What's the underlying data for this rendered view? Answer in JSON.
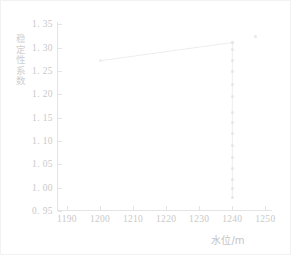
{
  "chart_data": {
    "type": "line",
    "title": "",
    "subtitle": "",
    "xlabel": "水位/m",
    "ylabel": "稳定性系数",
    "xlim": [
      1187,
      1252
    ],
    "ylim": [
      0.95,
      1.355
    ],
    "xticks": [
      1190,
      1200,
      1210,
      1220,
      1230,
      1240,
      1250
    ],
    "xtick_labels": [
      "1190",
      "1200",
      "1210",
      "1220",
      "1230",
      "1240",
      "1250"
    ],
    "yticks": [
      0.95,
      1.0,
      1.05,
      1.1,
      1.15,
      1.2,
      1.25,
      1.3,
      1.35
    ],
    "ytick_labels": [
      "0. 95",
      "1. 00",
      "1. 05",
      "1. 10",
      "1. 15",
      "1. 20",
      "1. 25",
      "1. 30",
      "1. 35"
    ],
    "grid": false,
    "legend": [],
    "legend_position": "none",
    "line_color": "#ededed",
    "marker_color": "#ededed",
    "series": [
      {
        "name": "稳定性系数",
        "style": "solid-line",
        "x": [
          1200,
          1240
        ],
        "values": [
          1.272,
          1.311
        ]
      },
      {
        "name": "水位1240处竖向序列",
        "style": "dotted-vertical",
        "x": [
          1240,
          1240,
          1240,
          1240,
          1240,
          1240,
          1240,
          1240,
          1240,
          1240,
          1240,
          1240,
          1240,
          1240,
          1240
        ],
        "values": [
          1.311,
          1.297,
          1.273,
          1.248,
          1.222,
          1.196,
          1.162,
          1.14,
          1.117,
          1.09,
          1.065,
          1.042,
          1.018,
          0.998,
          0.978
        ]
      },
      {
        "name": "孤立点",
        "style": "marker",
        "x": [
          1247
        ],
        "values": [
          1.325
        ]
      }
    ],
    "annotations": []
  },
  "axes": {
    "y_title": "稳定性系数",
    "x_title": "水位/m"
  }
}
